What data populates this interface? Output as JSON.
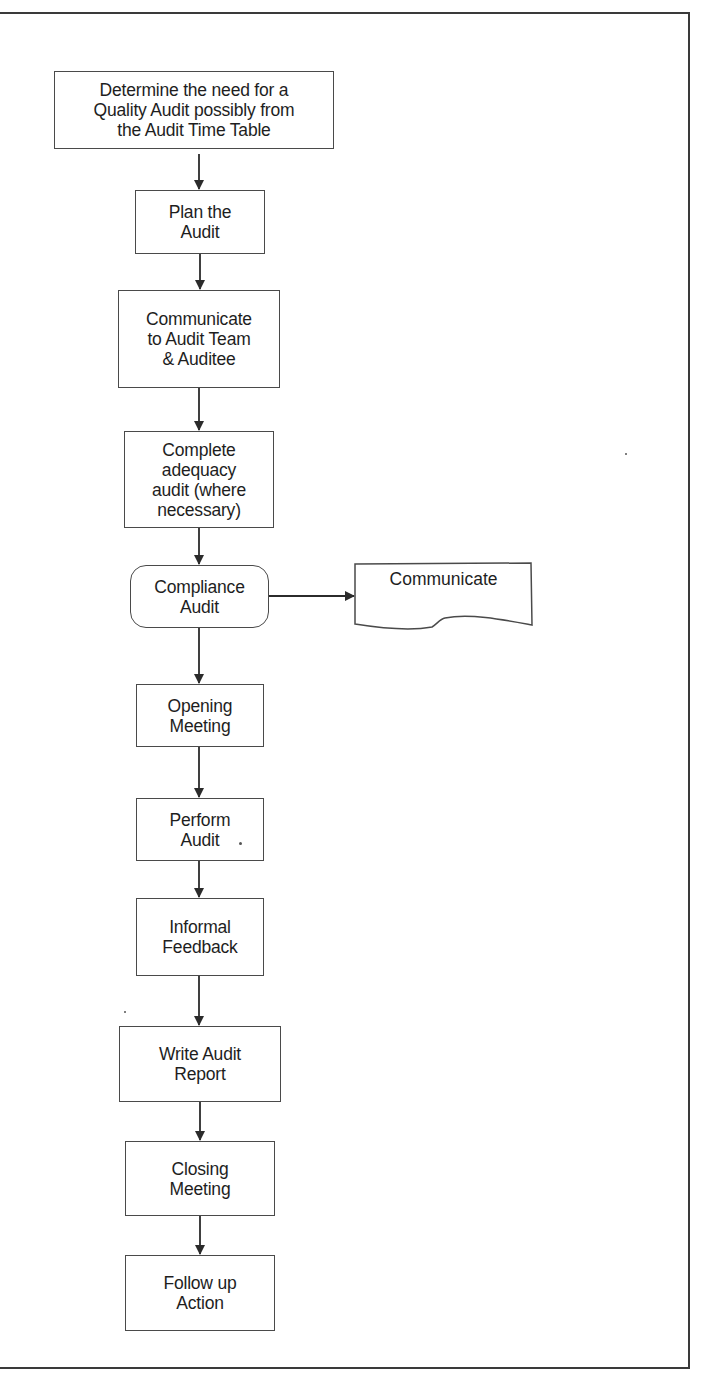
{
  "diagram": {
    "type": "flowchart",
    "direction": "top-to-bottom",
    "nodes": [
      {
        "id": "n1",
        "shape": "rectangle",
        "label": "Determine the need for a\nQuality Audit possibly from\nthe Audit Time Table"
      },
      {
        "id": "n2",
        "shape": "rectangle",
        "label": "Plan the\nAudit"
      },
      {
        "id": "n3",
        "shape": "rectangle",
        "label": "Communicate\nto Audit Team\n& Auditee"
      },
      {
        "id": "n4",
        "shape": "rectangle",
        "label": "Complete\nadequacy\naudit (where\nnecessary)"
      },
      {
        "id": "n5",
        "shape": "rounded-rectangle",
        "label": "Compliance\nAudit"
      },
      {
        "id": "n6",
        "shape": "document",
        "label": "Communicate"
      },
      {
        "id": "n7",
        "shape": "rectangle",
        "label": "Opening\nMeeting"
      },
      {
        "id": "n8",
        "shape": "rectangle",
        "label": "Perform\nAudit"
      },
      {
        "id": "n9",
        "shape": "rectangle",
        "label": "Informal\nFeedback"
      },
      {
        "id": "n10",
        "shape": "rectangle",
        "label": "Write Audit\nReport"
      },
      {
        "id": "n11",
        "shape": "rectangle",
        "label": "Closing\nMeeting"
      },
      {
        "id": "n12",
        "shape": "rectangle",
        "label": "Follow up\nAction"
      }
    ],
    "edges": [
      {
        "from": "n1",
        "to": "n2"
      },
      {
        "from": "n2",
        "to": "n3"
      },
      {
        "from": "n3",
        "to": "n4"
      },
      {
        "from": "n4",
        "to": "n5"
      },
      {
        "from": "n5",
        "to": "n6"
      },
      {
        "from": "n5",
        "to": "n7"
      },
      {
        "from": "n7",
        "to": "n8"
      },
      {
        "from": "n8",
        "to": "n9"
      },
      {
        "from": "n9",
        "to": "n10"
      },
      {
        "from": "n10",
        "to": "n11"
      },
      {
        "from": "n11",
        "to": "n12"
      }
    ]
  },
  "colors": {
    "line": "#2b2b2b",
    "border": "#4a4a4a",
    "text": "#1e1e1e",
    "background": "#ffffff"
  }
}
